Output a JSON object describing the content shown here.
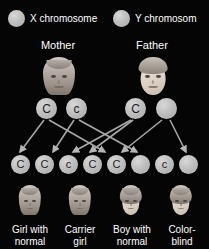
{
  "diagram": {
    "background_color": "#050505",
    "text_color": "#ffffff",
    "chromosome_color": "#bdbdbd",
    "line_color": "#9a9a9a"
  },
  "legend": [
    {
      "icon": "x-chromosome-circle",
      "label": "X chromosome"
    },
    {
      "icon": "y-chromosome-circle",
      "label": "Y chromosom"
    }
  ],
  "parents": [
    {
      "name": "Mother",
      "portrait": "mother-portrait",
      "gametes": [
        {
          "allele": "C"
        },
        {
          "allele": "c"
        }
      ]
    },
    {
      "name": "Father",
      "portrait": "father-portrait",
      "gametes": [
        {
          "allele": "C"
        },
        {
          "allele": ""
        }
      ]
    }
  ],
  "offspring_alleles": [
    {
      "allele": "C"
    },
    {
      "allele": "C"
    },
    {
      "allele": "c"
    },
    {
      "allele": "C"
    },
    {
      "allele": "C"
    },
    {
      "allele": ""
    },
    {
      "allele": "c"
    },
    {
      "allele": ""
    }
  ],
  "offspring": [
    {
      "portrait": "girl-normal-portrait",
      "label_line1": "Girl with",
      "label_line2": "normal"
    },
    {
      "portrait": "carrier-girl-portrait",
      "label_line1": "Carrier",
      "label_line2": "girl"
    },
    {
      "portrait": "boy-normal-portrait",
      "label_line1": "Boy with",
      "label_line2": "normal"
    },
    {
      "portrait": "colorblind-boy-portrait",
      "label_line1": "Color-",
      "label_line2": "blind"
    }
  ]
}
